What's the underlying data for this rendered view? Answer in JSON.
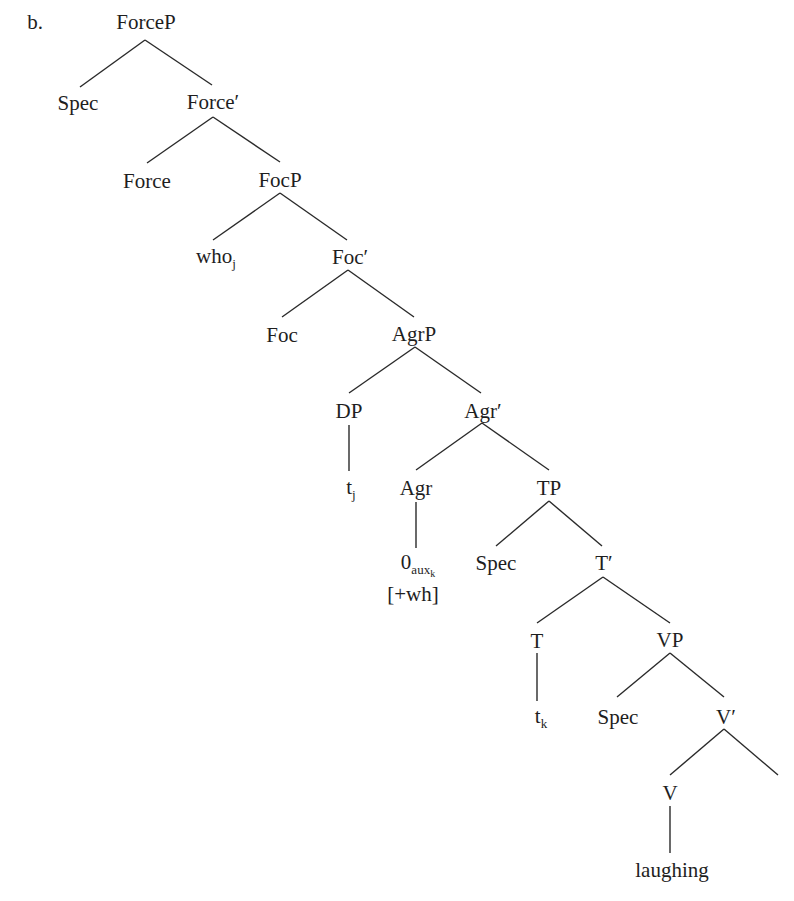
{
  "example_label": "b.",
  "tree": {
    "nodes": {
      "forcep": {
        "text": "ForceP"
      },
      "spec1": {
        "text": "Spec"
      },
      "force_bar": {
        "text": "Force′"
      },
      "force": {
        "text": "Force"
      },
      "focp": {
        "text": "FocP"
      },
      "who": {
        "text": "who",
        "sub": "j"
      },
      "foc_bar": {
        "text": "Foc′"
      },
      "foc": {
        "text": "Foc"
      },
      "agrp": {
        "text": "AgrP"
      },
      "dp": {
        "text": "DP"
      },
      "agr_bar": {
        "text": "Agr′"
      },
      "tj": {
        "text": "t",
        "sub": "j"
      },
      "agr": {
        "text": "Agr"
      },
      "tp": {
        "text": "TP"
      },
      "null_aux": {
        "text": "0",
        "sub": "aux",
        "subsub": "k"
      },
      "wh_feature": {
        "text": "[+wh]"
      },
      "spec2": {
        "text": "Spec"
      },
      "t_bar": {
        "text": "T′"
      },
      "t": {
        "text": "T"
      },
      "vp": {
        "text": "VP"
      },
      "tk": {
        "text": "t",
        "sub": "k"
      },
      "spec3": {
        "text": "Spec"
      },
      "v_bar": {
        "text": "V′"
      },
      "v": {
        "text": "V"
      },
      "laughing": {
        "text": "laughing"
      }
    }
  }
}
